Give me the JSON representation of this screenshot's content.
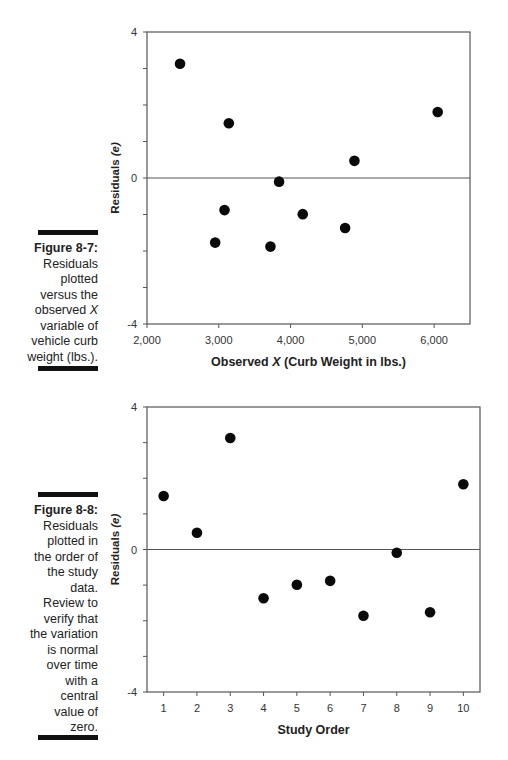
{
  "figures": [
    {
      "label": "Figure 8-7:",
      "caption_lines": [
        "Residuals",
        "plotted",
        "versus the",
        "observed X",
        "variable of",
        "vehicle curb",
        "weight (lbs.)."
      ],
      "caption_text": "Residuals plotted versus the observed X variable of vehicle curb weight (lbs.)."
    },
    {
      "label": "Figure 8-8:",
      "caption_lines": [
        "Residuals",
        "plotted in",
        "the order of",
        "the study",
        "data.",
        "Review to",
        "verify that",
        "the variation",
        "is normal",
        "over time",
        "with a",
        "central",
        "value of",
        "zero."
      ],
      "caption_text": "Residuals plotted in the order of the study data. Review to verify that the variation is normal over time with a central value of zero."
    }
  ],
  "chart_data": [
    {
      "type": "scatter",
      "title": "",
      "xlabel": "Observed X (Curb Weight in lbs.)",
      "ylabel": "Residuals (e)",
      "xlim": [
        2000,
        6500
      ],
      "ylim": [
        -4,
        4
      ],
      "x_ticks": [
        "2,000",
        "3,000",
        "4,000",
        "5,000",
        "6,000"
      ],
      "y_ticks": [
        "4",
        "0",
        "-4"
      ],
      "grid": false,
      "reference_line_y": 0,
      "points": [
        {
          "x": 2460,
          "y": 3.13
        },
        {
          "x": 2950,
          "y": -1.77
        },
        {
          "x": 3080,
          "y": -0.88
        },
        {
          "x": 3140,
          "y": 1.5
        },
        {
          "x": 3720,
          "y": -1.88
        },
        {
          "x": 3840,
          "y": -0.1
        },
        {
          "x": 4170,
          "y": -0.99
        },
        {
          "x": 4760,
          "y": -1.37
        },
        {
          "x": 4890,
          "y": 0.47
        },
        {
          "x": 6050,
          "y": 1.81
        }
      ]
    },
    {
      "type": "scatter",
      "title": "",
      "xlabel": "Study Order",
      "ylabel": "Residuals (e)",
      "xlim": [
        0.5,
        10.5
      ],
      "ylim": [
        -4,
        4
      ],
      "x_ticks": [
        "1",
        "2",
        "3",
        "4",
        "5",
        "6",
        "7",
        "8",
        "9",
        "10"
      ],
      "y_ticks": [
        "4",
        "0",
        "-4"
      ],
      "grid": false,
      "reference_line_y": 0,
      "points": [
        {
          "x": 1,
          "y": 1.5
        },
        {
          "x": 2,
          "y": 0.47
        },
        {
          "x": 3,
          "y": 3.13
        },
        {
          "x": 4,
          "y": -1.37
        },
        {
          "x": 5,
          "y": -0.99
        },
        {
          "x": 6,
          "y": -0.88
        },
        {
          "x": 7,
          "y": -1.86
        },
        {
          "x": 8,
          "y": -0.09
        },
        {
          "x": 9,
          "y": -1.76
        },
        {
          "x": 10,
          "y": 1.83
        }
      ]
    }
  ]
}
